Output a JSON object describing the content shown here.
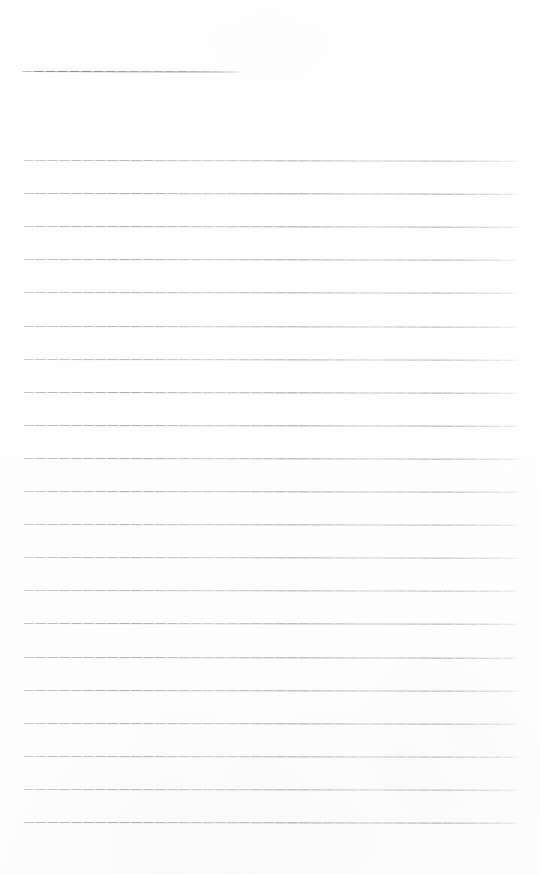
{
  "document": {
    "kind": "scanned-blank-ruled-paper",
    "page_label": "",
    "background_color": "#ffffff",
    "rule_color": "#9b9ba4",
    "width_px": 540,
    "height_px": 874,
    "text_content": "",
    "visible_text": []
  },
  "rules": {
    "header_rule": {
      "name": "header-short-rule",
      "x": 22,
      "y": 71,
      "width": 218,
      "thickness": 1
    },
    "body_rule_left_x": 24,
    "body_rule_width": 494,
    "body_rule_spacing": 33.1,
    "body_rule_thickness": 1,
    "body_rules_y": [
      160.0,
      193.1,
      226.2,
      259.3,
      292.4,
      325.5,
      358.6,
      391.7,
      424.8,
      457.9,
      491.0,
      524.1,
      557.2,
      590.3,
      623.4,
      656.5,
      689.6,
      722.7,
      755.8,
      788.9,
      822.0
    ]
  }
}
